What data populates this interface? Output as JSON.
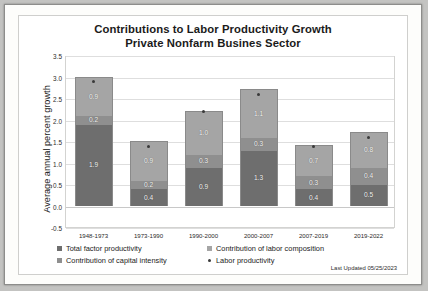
{
  "chart_data": {
    "type": "bar",
    "subtype": "stacked-bar-with-marker",
    "title": "Contributions to Labor Productivity Growth",
    "subtitle": "Private Nonfarm Busines Sector",
    "xlabel": "",
    "ylabel": "Average annual percent growth",
    "ylim": [
      -0.5,
      3.5
    ],
    "ytick_step": 0.5,
    "yticks": [
      "3.5",
      "3.0",
      "2.5",
      "2.0",
      "1.5",
      "1.0",
      "0.5",
      "0.0",
      "-0.5"
    ],
    "grid": true,
    "legend_position": "bottom",
    "categories": [
      "1948-1973",
      "1973-1990",
      "1990-2000",
      "2000-2007",
      "2007-2019",
      "2019-2022"
    ],
    "series": [
      {
        "name": "Total factor productivity",
        "color": "#6e6e6e",
        "values": [
          1.9,
          0.4,
          0.9,
          1.3,
          0.4,
          0.5
        ]
      },
      {
        "name": "Contribution of capital intensity",
        "color": "#8f8f8f",
        "values": [
          0.2,
          0.2,
          0.3,
          0.3,
          0.3,
          0.4
        ]
      },
      {
        "name": "Contribution of labor composition",
        "color": "#a5a5a5",
        "values": [
          0.9,
          0.9,
          1.0,
          1.1,
          0.7,
          0.8
        ]
      }
    ],
    "marker_series": {
      "name": "Labor productivity",
      "color": "#3a3a3a",
      "values": [
        2.9,
        1.4,
        2.2,
        2.6,
        1.4,
        1.6
      ]
    },
    "bar_labels": [
      {
        "category": "1948-1973",
        "labor_composition": "0.9",
        "capital_intensity": "0.2",
        "total_factor_productivity": "1.9"
      },
      {
        "category": "1973-1990",
        "labor_composition": "0.9",
        "capital_intensity": "0.2",
        "total_factor_productivity": "0.4"
      },
      {
        "category": "1990-2000",
        "labor_composition": "1.0",
        "capital_intensity": "0.3",
        "total_factor_productivity": "0.9"
      },
      {
        "category": "2000-2007",
        "labor_composition": "1.1",
        "capital_intensity": "0.3",
        "total_factor_productivity": "1.3"
      },
      {
        "category": "2007-2019",
        "labor_composition": "0.7",
        "capital_intensity": "0.3",
        "total_factor_productivity": "0.4"
      },
      {
        "category": "2019-2022",
        "labor_composition": "0.8",
        "capital_intensity": "0.4",
        "total_factor_productivity": "0.5"
      }
    ]
  },
  "legend": {
    "items": [
      {
        "label": "Total factor productivity",
        "color": "#6e6e6e",
        "shape": "square"
      },
      {
        "label": "Contribution of labor composition",
        "color": "#a5a5a5",
        "shape": "square"
      },
      {
        "label": "Contribution of capital intensity",
        "color": "#8f8f8f",
        "shape": "square"
      },
      {
        "label": "Labor productivity",
        "color": "#3a3a3a",
        "shape": "dot"
      }
    ]
  },
  "footer": {
    "last_updated": "Last Updated 05/25/2023"
  }
}
